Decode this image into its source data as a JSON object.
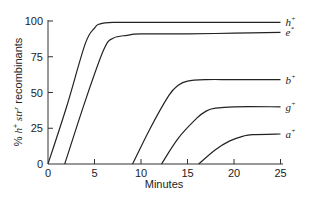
{
  "chart_data": {
    "type": "line",
    "title": "",
    "xlabel": "Minutes",
    "ylabel": "% h+ str r recombinants",
    "ylabel_parts": {
      "prefix": "% ",
      "h": "h",
      "h_sup": "+",
      "str": " str",
      "str_sup": "r",
      "suffix": " recombinants"
    },
    "xlim": [
      0,
      25
    ],
    "ylim": [
      0,
      100
    ],
    "xticks": [
      0,
      5,
      10,
      15,
      20,
      25
    ],
    "yticks": [
      0,
      25,
      50,
      75,
      100
    ],
    "xtick_labels": [
      "0",
      "5",
      "10",
      "15",
      "20",
      "25"
    ],
    "ytick_labels": [
      "0",
      "25",
      "50",
      "75",
      "100"
    ],
    "grid": false,
    "legend_position": "inline-right",
    "series": [
      {
        "name": "h+",
        "base": "h",
        "sup": "+",
        "x": [
          0,
          2,
          4,
          5,
          5.6,
          7,
          10,
          15,
          20,
          25
        ],
        "values": [
          0,
          40,
          84,
          95,
          98,
          99,
          99,
          99,
          99,
          99
        ]
      },
      {
        "name": "e+",
        "base": "e",
        "sup": "*",
        "x": [
          1.8,
          4,
          6,
          7,
          8.5,
          10,
          15,
          20,
          25
        ],
        "values": [
          0,
          44,
          80,
          88,
          90,
          91,
          91,
          91.5,
          92
        ]
      },
      {
        "name": "b+",
        "base": "b",
        "sup": "+",
        "x": [
          9.1,
          11,
          13,
          14,
          15,
          17,
          20,
          25
        ],
        "values": [
          0,
          25,
          48,
          55,
          58,
          59,
          59,
          59
        ]
      },
      {
        "name": "g+",
        "base": "g",
        "sup": "+",
        "x": [
          12.2,
          14,
          16,
          17,
          18,
          20,
          25
        ],
        "values": [
          0,
          18,
          32,
          37,
          39,
          40,
          40
        ]
      },
      {
        "name": "a+",
        "base": "a",
        "sup": "+",
        "x": [
          16.2,
          18,
          19.5,
          21,
          22,
          25
        ],
        "values": [
          0,
          10,
          16,
          19.5,
          20.5,
          21
        ]
      }
    ]
  }
}
